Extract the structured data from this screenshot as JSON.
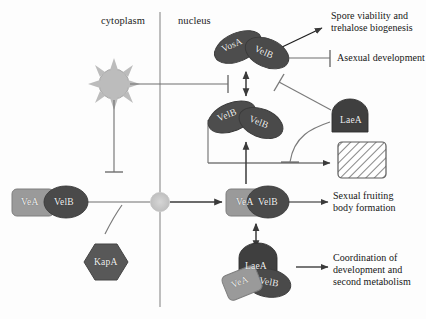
{
  "figure": {
    "type": "biological-signaling-pathway-diagram",
    "organism_context": "fungal velvet complex regulation"
  },
  "compartments": {
    "cytoplasm": "cytoplasm",
    "nucleus": "nucleus"
  },
  "colors": {
    "dark_protein": "#4a4a4a",
    "mid_protein": "#5c5c5c",
    "light_protein": "#9a9a9a",
    "laea_fill": "#3f3f3f",
    "kapa_fill": "#585858",
    "light_sensor": "#b9b9b9",
    "pore": "#c9c9c9",
    "line": "#6e6e6e",
    "arrow_dark": "#3a3a3a",
    "text": "#161616",
    "hatch_box_border": "#5a5a5a"
  },
  "light_sensor": {
    "name": "light-stimulus",
    "rays": 8
  },
  "nuclear_pore": {
    "name": "nuclear-pore"
  },
  "complexes": {
    "cytoplasmic_veaVelb": {
      "id": "cyto-vea-velb",
      "subunits": [
        "VeA",
        "VelB"
      ],
      "shape": "rounded-rect + ellipse"
    },
    "vosa_velb": {
      "id": "vosa-velb",
      "subunits": [
        "VosA",
        "VelB"
      ],
      "shape": "two tilted ellipses"
    },
    "velb_velb": {
      "id": "velb-velb",
      "subunits": [
        "VelB",
        "VelB"
      ],
      "shape": "two tilted ellipses"
    },
    "nuclear_veaVelb": {
      "id": "nuc-vea-velb",
      "subunits": [
        "VeA",
        "VelB"
      ],
      "shape": "rounded-rect + ellipse"
    },
    "laea_vea_velb": {
      "id": "laea-vea-velb",
      "subunits": [
        "LaeA",
        "VeA",
        "VelB"
      ],
      "shape": "trimeric"
    },
    "laea_solo": {
      "id": "laea",
      "label": "LaeA",
      "shape": "dome"
    },
    "kapa": {
      "id": "kapa",
      "label": "KapA",
      "shape": "hexagon"
    },
    "hatched_box": {
      "id": "secondary-metabolism-box",
      "label": "",
      "shape": "hatched rectangle"
    }
  },
  "outcomes": [
    {
      "id": "spore-viability",
      "text": "Spore viability and\ntrehalose biogenesis",
      "edge": "activation"
    },
    {
      "id": "asexual-development",
      "text": "Asexual development",
      "edge": "inhibition"
    },
    {
      "id": "sexual-fruiting",
      "text": "Sexual fruiting\nbody formation",
      "edge": "activation"
    },
    {
      "id": "coordination",
      "text": "Coordination of\ndevelopment and\nsecond metabolism",
      "edge": "activation"
    }
  ],
  "labels": {
    "vea": "VeA",
    "velb": "VelB",
    "vosa": "VosA",
    "laea": "LaeA",
    "kapa": "KapA"
  }
}
